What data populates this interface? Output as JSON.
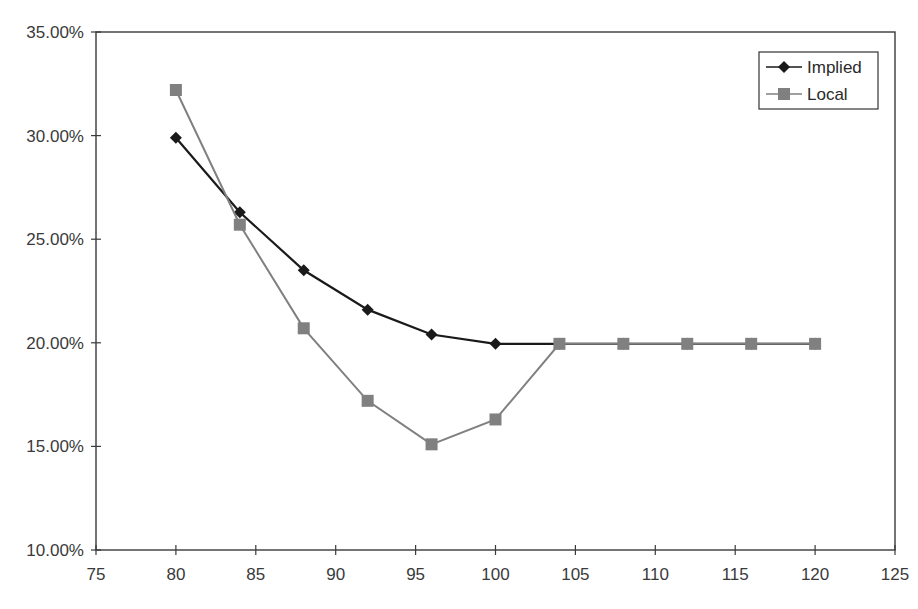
{
  "chart_data": {
    "type": "line",
    "title": "",
    "xlabel": "",
    "ylabel": "",
    "xlim": [
      75,
      125
    ],
    "ylim": [
      0.1,
      0.35
    ],
    "x_ticks": [
      75,
      80,
      85,
      90,
      95,
      100,
      105,
      110,
      115,
      120,
      125
    ],
    "y_ticks": [
      0.1,
      0.15,
      0.2,
      0.25,
      0.3,
      0.35
    ],
    "y_tick_labels": [
      "10.00%",
      "15.00%",
      "20.00%",
      "25.00%",
      "30.00%",
      "35.00%"
    ],
    "x_tick_labels": [
      "75",
      "80",
      "85",
      "90",
      "95",
      "100",
      "105",
      "110",
      "115",
      "120",
      "125"
    ],
    "grid": false,
    "legend_position": "top-right",
    "x": [
      80,
      84,
      88,
      92,
      96,
      100,
      104,
      108,
      112,
      116,
      120
    ],
    "series": [
      {
        "name": "Implied",
        "marker": "diamond",
        "color": "#1a1a1a",
        "values": [
          0.299,
          0.263,
          0.235,
          0.216,
          0.204,
          0.1995,
          0.1995,
          0.1995,
          0.1995,
          0.1995,
          0.1995
        ]
      },
      {
        "name": "Local",
        "marker": "square",
        "color": "#808080",
        "values": [
          0.322,
          0.257,
          0.207,
          0.172,
          0.151,
          0.163,
          0.1995,
          0.1995,
          0.1995,
          0.1995,
          0.1995
        ]
      }
    ]
  },
  "legend": {
    "items": [
      {
        "label": "Implied"
      },
      {
        "label": "Local"
      }
    ]
  }
}
